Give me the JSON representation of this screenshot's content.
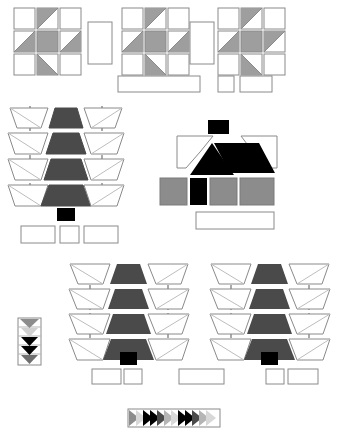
{
  "figure": {
    "background_color": "#ffffff",
    "width": 345,
    "height": 439
  },
  "palette": {
    "outline": "#8a8a8a",
    "outline_dark": "#707070",
    "white": "#ffffff",
    "light_gray": "#cfcfcf",
    "mid_gray": "#9e9e9e",
    "gray": "#8c8c8c",
    "dark_gray": "#4a4a4a",
    "black": "#000000",
    "house_body_gray": "#8c8c8c",
    "dashed_line": "#555555"
  },
  "sections": {
    "top": {
      "name": "tile-grid-row",
      "grids": [
        {
          "id": "grid-left",
          "x": 14,
          "y": 8,
          "cell": 21,
          "gap": 2,
          "cells": [
            {
              "fill": "none",
              "tri": "none"
            },
            {
              "fill": "none",
              "tri": "upper-left",
              "tri_color": "#9e9e9e"
            },
            {
              "fill": "none",
              "tri": "none"
            },
            {
              "fill": "none",
              "tri": "lower-left",
              "tri_color": "#9e9e9e"
            },
            {
              "fill": "#9e9e9e",
              "tri": "none"
            },
            {
              "fill": "none",
              "tri": "lower-left",
              "tri_color": "#9e9e9e"
            },
            {
              "fill": "none",
              "tri": "none"
            },
            {
              "fill": "none",
              "tri": "upper-right",
              "tri_color": "#9e9e9e"
            },
            {
              "fill": "none",
              "tri": "none"
            }
          ]
        },
        {
          "id": "grid-middle",
          "x": 122,
          "y": 8,
          "cell": 21,
          "gap": 2,
          "cells": [
            {
              "fill": "none",
              "tri": "none"
            },
            {
              "fill": "none",
              "tri": "upper-left",
              "tri_color": "#9e9e9e"
            },
            {
              "fill": "none",
              "tri": "none"
            },
            {
              "fill": "none",
              "tri": "lower-left",
              "tri_color": "#9e9e9e"
            },
            {
              "fill": "#9e9e9e",
              "tri": "none"
            },
            {
              "fill": "none",
              "tri": "lower-left",
              "tri_color": "#9e9e9e"
            },
            {
              "fill": "none",
              "tri": "none"
            },
            {
              "fill": "none",
              "tri": "upper-right",
              "tri_color": "#9e9e9e"
            },
            {
              "fill": "none",
              "tri": "none"
            }
          ]
        },
        {
          "id": "grid-right",
          "x": 218,
          "y": 8,
          "cell": 21,
          "gap": 2,
          "cells": [
            {
              "fill": "none",
              "tri": "none"
            },
            {
              "fill": "none",
              "tri": "upper-left",
              "tri_color": "#9e9e9e"
            },
            {
              "fill": "none",
              "tri": "none"
            },
            {
              "fill": "none",
              "tri": "lower-left",
              "tri_color": "#9e9e9e"
            },
            {
              "fill": "#9e9e9e",
              "tri": "none"
            },
            {
              "fill": "none",
              "tri": "upper-right",
              "tri_color": "#9e9e9e"
            },
            {
              "fill": "none",
              "tri": "none"
            },
            {
              "fill": "none",
              "tri": "upper-left",
              "tri_color": "#9e9e9e"
            },
            {
              "fill": "none",
              "tri": "none"
            }
          ]
        }
      ],
      "separators": [
        {
          "id": "sep-1",
          "x": 88,
          "y": 22,
          "w": 24,
          "h": 42
        },
        {
          "id": "sep-2",
          "x": 190,
          "y": 22,
          "w": 24,
          "h": 42
        }
      ],
      "caption_boxes": [
        {
          "id": "cap-wide",
          "x": 118,
          "y": 76,
          "w": 82,
          "h": 16
        },
        {
          "id": "cap-small",
          "x": 218,
          "y": 76,
          "w": 16,
          "h": 16
        },
        {
          "id": "cap-med",
          "x": 240,
          "y": 76,
          "w": 32,
          "h": 16
        }
      ]
    },
    "middle_left": {
      "name": "trapezoid-stack-left",
      "x": 8,
      "y": 104,
      "rows": 4,
      "row_height": 26,
      "center_fill": "#4a4a4a",
      "wing_fill": "#ffffff",
      "dashed_guides": [
        22,
        105
      ],
      "base_marker": {
        "id": "black-base-marker",
        "x": 57,
        "y": 208,
        "w": 18,
        "h": 13,
        "fill": "#000000"
      },
      "caption_boxes": [
        {
          "id": "cap-l1",
          "x": 21,
          "y": 226,
          "w": 34,
          "h": 17
        },
        {
          "id": "cap-l2",
          "x": 60,
          "y": 226,
          "w": 19,
          "h": 17
        },
        {
          "id": "cap-l3",
          "x": 84,
          "y": 226,
          "w": 34,
          "h": 17
        }
      ]
    },
    "middle_right": {
      "name": "house-figure",
      "chimney": {
        "x": 208,
        "y": 120,
        "w": 21,
        "h": 14,
        "fill": "#000000"
      },
      "roof_left_wing": {
        "fill": "#ffffff"
      },
      "roof_right_wing": {
        "fill": "#ffffff"
      },
      "roof_gable": {
        "fill": "#000000"
      },
      "roof_slab": {
        "fill": "#000000"
      },
      "body_blocks": [
        {
          "id": "body-1",
          "x": 160,
          "y": 178,
          "w": 27,
          "h": 27,
          "fill": "#8c8c8c"
        },
        {
          "id": "body-door",
          "x": 190,
          "y": 178,
          "w": 17,
          "h": 27,
          "fill": "#000000"
        },
        {
          "id": "body-2",
          "x": 210,
          "y": 178,
          "w": 27,
          "h": 27,
          "fill": "#8c8c8c"
        },
        {
          "id": "body-3",
          "x": 240,
          "y": 178,
          "w": 34,
          "h": 27,
          "fill": "#8c8c8c"
        }
      ],
      "caption_boxes": [
        {
          "id": "cap-house",
          "x": 196,
          "y": 212,
          "w": 78,
          "h": 17
        }
      ]
    },
    "bottom": {
      "name": "trapezoid-stack-row",
      "legend": {
        "id": "chevron-legend",
        "x": 18,
        "y": 318,
        "w": 22,
        "h": 46,
        "items": [
          {
            "index": 0,
            "fill": "#8c8c8c"
          },
          {
            "index": 1,
            "fill": "#d0d0d0"
          },
          {
            "index": 2,
            "fill": "#000000"
          },
          {
            "index": 3,
            "fill": "#000000"
          },
          {
            "index": 4,
            "fill": "#6e6e6e"
          }
        ]
      },
      "stacks": [
        {
          "id": "stack-bottom-left",
          "x": 68,
          "y": 262,
          "rows": 4,
          "row_height": 26,
          "center_fill": "#4a4a4a",
          "dashed_guides": [
            22,
            105
          ],
          "base_marker": {
            "x": 120,
            "y": 352,
            "w": 17,
            "h": 13,
            "fill": "#000000"
          },
          "caption_boxes": [
            {
              "id": "cap-bl1",
              "x": 92,
              "y": 369,
              "w": 29,
              "h": 15
            },
            {
              "id": "cap-bl2",
              "x": 124,
              "y": 369,
              "w": 18,
              "h": 15
            }
          ]
        },
        {
          "id": "stack-bottom-right",
          "x": 208,
          "y": 262,
          "rows": 4,
          "row_height": 26,
          "center_fill": "#4a4a4a",
          "dashed_guides": [
            22,
            105
          ],
          "base_marker": {
            "x": 261,
            "y": 352,
            "w": 17,
            "h": 13,
            "fill": "#000000"
          },
          "caption_boxes": [
            {
              "id": "cap-br1",
              "x": 266,
              "y": 369,
              "w": 18,
              "h": 15
            },
            {
              "id": "cap-br2",
              "x": 288,
              "y": 369,
              "w": 30,
              "h": 15
            }
          ]
        }
      ],
      "center_caption": {
        "id": "cap-bottom-center",
        "x": 179,
        "y": 369,
        "w": 45,
        "h": 15
      },
      "arrow_strip": {
        "id": "arrow-strip",
        "x": 128,
        "y": 409,
        "w": 92,
        "h": 18,
        "arrows": [
          {
            "index": 0,
            "fill": "#8c8c8c"
          },
          {
            "index": 1,
            "fill": "#d8d8d8"
          },
          {
            "index": 2,
            "fill": "#000000"
          },
          {
            "index": 3,
            "fill": "#000000"
          },
          {
            "index": 4,
            "fill": "#4a4a4a"
          },
          {
            "index": 5,
            "fill": "#b5b5b5"
          },
          {
            "index": 6,
            "fill": "#d8d8d8"
          },
          {
            "index": 7,
            "fill": "#000000"
          },
          {
            "index": 8,
            "fill": "#000000"
          },
          {
            "index": 9,
            "fill": "#4a4a4a"
          },
          {
            "index": 10,
            "fill": "#b5b5b5"
          },
          {
            "index": 11,
            "fill": "#d8d8d8"
          }
        ]
      }
    }
  }
}
